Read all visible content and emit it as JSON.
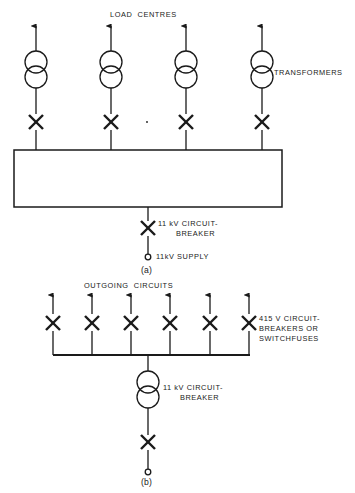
{
  "figure": {
    "title_a": "(a)",
    "title_b": "(b)"
  },
  "diagram_a": {
    "label_load_centres": "LOAD  CENTRES",
    "label_transformers": "TRANSFORMERS",
    "label_hv_breaker_line1": "11 kV CIRCUIT-",
    "label_hv_breaker_line2": "BREAKER",
    "label_supply": "11kV SUPPLY",
    "feeder_count": 4,
    "feeder_x": [
      36,
      111,
      186,
      262
    ],
    "arrow_top_y": 22,
    "transformer_top_cy": 62,
    "transformer_bot_cy": 77,
    "transformer_r": 11,
    "breaker_y": 122,
    "busbar": {
      "x": 14,
      "y": 150,
      "width": 268,
      "height": 57
    },
    "supply_x": 148,
    "supply_breaker_y": 228,
    "supply_terminal_y": 257
  },
  "diagram_b": {
    "label_outgoing_circuits": "OUTGOING  CIRCUITS",
    "label_lv_breakers_line1": "415 V CIRCUIT-",
    "label_lv_breakers_line2": "BREAKERS OR",
    "label_lv_breakers_line3": "SWITCHFUSES",
    "label_hv_breaker_line1": "11 kV CIRCUIT-",
    "label_hv_breaker_line2": "BREAKER",
    "outgoing_count": 6,
    "outgoing_x": [
      53,
      92,
      131,
      170,
      210,
      249
    ],
    "arrow_top_y": 291,
    "breaker_y": 323,
    "busbar_y": 355,
    "busbar_x1": 53,
    "busbar_x2": 250,
    "transformer_x": 148,
    "transformer_top_cy": 382,
    "transformer_bot_cy": 397,
    "transformer_r": 11,
    "incomer_breaker_y": 442,
    "incomer_terminal_y": 472
  },
  "style": {
    "line_color": "#1a1a1a",
    "text_color": "#1a1a1a",
    "background": "#ffffff",
    "line_width": 1.3,
    "breaker_line_width": 2.4
  }
}
